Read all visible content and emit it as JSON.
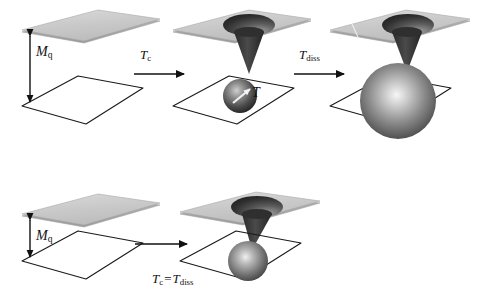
{
  "figure": {
    "name": "deconfinement-schematic",
    "background_color": "#ffffff"
  },
  "colors": {
    "plate_fill": "#c9c9c9",
    "plate_fill_light": "#d8d8d8",
    "plate_edge": "#8a8a8a",
    "outline": "#1a1a1a",
    "cone_dark": "#3a3a3a",
    "cone_mid": "#555555",
    "hole_dark": "#2b2b2b",
    "sphere_highlight": "#f2f2f2",
    "sphere_dark": "#1e1e1e",
    "arrow": "#111111"
  },
  "labels": {
    "mq_top": {
      "symbol": "M",
      "subscript": "q"
    },
    "mq_bottom": {
      "symbol": "M",
      "subscript": "q"
    },
    "tc_arrow": {
      "symbol": "T",
      "subscript": "c"
    },
    "tdiss_arrow": {
      "symbol": "T",
      "subscript": "diss"
    },
    "t_sphere": {
      "symbol": "T",
      "subscript": ""
    },
    "tc_eq_tdiss": {
      "left_symbol": "T",
      "left_subscript": "c",
      "operator": "=",
      "right_symbol": "T",
      "right_subscript": "diss"
    }
  },
  "rows": [
    {
      "name": "top-row",
      "panels": [
        {
          "name": "panel-1-separated",
          "has_top_plate": true,
          "has_hole": false,
          "has_cone": false,
          "has_sphere": false,
          "has_gap_arrow": true,
          "gap_arrow_label": "M_q"
        },
        {
          "name": "panel-2-small-sphere",
          "has_top_plate": true,
          "has_hole": true,
          "has_cone": true,
          "has_sphere": true,
          "sphere_size": "small",
          "sphere_has_vector": true,
          "sphere_label": "T"
        },
        {
          "name": "panel-3-large-sphere",
          "has_top_plate": true,
          "has_hole": true,
          "has_cone": true,
          "has_sphere": true,
          "sphere_size": "large",
          "sphere_has_vector": false,
          "sphere_label": ""
        }
      ],
      "arrows": [
        {
          "name": "arrow-tc",
          "label": "T_c",
          "direction": "right"
        },
        {
          "name": "arrow-tdiss",
          "label": "T_diss",
          "direction": "right"
        }
      ]
    },
    {
      "name": "bottom-row",
      "panels": [
        {
          "name": "panel-4-separated",
          "has_top_plate": true,
          "has_hole": false,
          "has_cone": false,
          "has_sphere": false,
          "has_gap_arrow": true,
          "gap_arrow_label": "M_q"
        },
        {
          "name": "panel-5-touching-sphere",
          "has_top_plate": true,
          "has_hole": true,
          "has_cone": true,
          "has_sphere": true,
          "sphere_size": "medium",
          "sphere_has_vector": false,
          "sphere_label": ""
        }
      ],
      "arrows": [
        {
          "name": "arrow-tc-eq-tdiss",
          "label": "T_c = T_diss",
          "direction": "right"
        }
      ]
    }
  ]
}
